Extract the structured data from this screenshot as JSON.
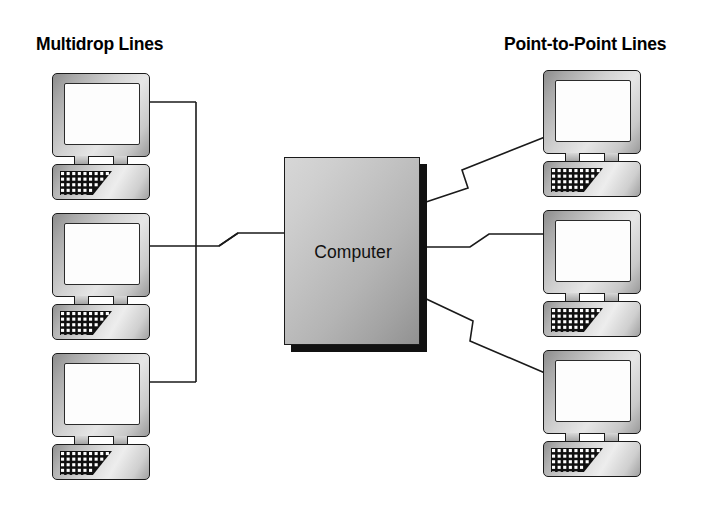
{
  "diagram": {
    "title_left": "Multidrop Lines",
    "title_right": "Point-to-Point Lines",
    "center_node_label": "Computer",
    "colors": {
      "background": "#ffffff",
      "line": "#1a1a1a",
      "text": "#000000",
      "device_body_light": "#ededed",
      "device_body_dark": "#8c8c8c",
      "screen": "#fdfdfd",
      "shadow": "#111111"
    }
  },
  "terminals_left": [
    {
      "id": "multidrop-terminal-1",
      "x": 52,
      "y": 73
    },
    {
      "id": "multidrop-terminal-2",
      "x": 52,
      "y": 213
    },
    {
      "id": "multidrop-terminal-3",
      "x": 52,
      "y": 353
    }
  ],
  "terminals_right": [
    {
      "id": "p2p-terminal-1",
      "x": 543,
      "y": 70
    },
    {
      "id": "p2p-terminal-2",
      "x": 543,
      "y": 210
    },
    {
      "id": "p2p-terminal-3",
      "x": 543,
      "y": 350
    }
  ],
  "computer": {
    "x": 284,
    "y": 157,
    "width": 136,
    "height": 188,
    "shadow_offset": 7
  },
  "connections": {
    "multidrop_bus_x": 196,
    "multidrop_stub_ys": [
      102,
      242,
      382
    ],
    "multidrop_trunk_y": 246,
    "point_to_point": [
      {
        "id": "p2p-link-top",
        "from_y": 204,
        "to_y": 137
      },
      {
        "id": "p2p-link-middle",
        "from_y": 247,
        "to_y": 247
      },
      {
        "id": "p2p-link-bottom",
        "from_y": 296,
        "to_y": 373
      }
    ]
  },
  "keyboard": {
    "rows": 6,
    "cols_per_row": [
      9,
      8,
      7,
      6,
      5,
      4
    ],
    "dot_pitch": 5.6,
    "dot_size": 3.1
  }
}
